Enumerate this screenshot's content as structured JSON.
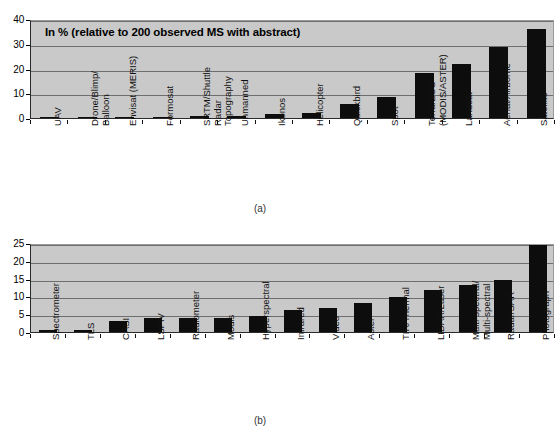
{
  "figure": {
    "panels": [
      {
        "id": "a",
        "caption": "(a)"
      },
      {
        "id": "b",
        "caption": "(b)"
      }
    ]
  },
  "chart_data": [
    {
      "type": "bar",
      "panel": "(a)",
      "title": "In % (relative to 200 observed MS with abstract)",
      "xlabel": "",
      "ylabel": "",
      "ylim": [
        0,
        40
      ],
      "yticks": [
        0,
        10,
        20,
        30,
        40
      ],
      "grid": true,
      "legend": "none",
      "categories": [
        "UAV",
        "Drone/Blimp/ Balloon",
        "Envisat (MERIS)",
        "Formosat",
        "SRTM/Shuttle Radar Topography",
        "Unmanned",
        "Ikonos",
        "Helicopter",
        "Quickbird",
        "Spot",
        "Terra/EOS (MODIS/ASTER)",
        "Landsat",
        "Aerial/Airborne",
        "Satellite"
      ],
      "category_lines": [
        [
          "UAV"
        ],
        [
          "Drone/Blimp/",
          "Balloon"
        ],
        [
          "Envisat (MERIS)"
        ],
        [
          "Formosat"
        ],
        [
          "SRTM/Shuttle",
          "Radar",
          "Topography"
        ],
        [
          "Unmanned"
        ],
        [
          "Ikonos"
        ],
        [
          "Helicopter"
        ],
        [
          "Quickbird"
        ],
        [
          "Spot"
        ],
        [
          "Terra/EOS",
          "(MODIS/ASTER)"
        ],
        [
          "Landsat"
        ],
        [
          "Aerial/Airborne"
        ],
        [
          "Satellite"
        ]
      ],
      "values": [
        0.5,
        0.5,
        0.5,
        0.5,
        1,
        1,
        1.5,
        2,
        5.5,
        8.5,
        18,
        22,
        28.5,
        36
      ]
    },
    {
      "type": "bar",
      "panel": "(b)",
      "title": "",
      "xlabel": "",
      "ylabel": "",
      "ylim": [
        0,
        25
      ],
      "yticks": [
        0,
        5,
        10,
        15,
        20,
        25
      ],
      "grid": true,
      "legend": "none",
      "categories": [
        "Spectrometer",
        "TLS",
        "CASI",
        "LSPIV",
        "Radiometer",
        "Modis",
        "Hyperspectral",
        "Infrared",
        "Video",
        "Aster",
        "TIR/Thermal",
        "LIDAR/Laser",
        "Multi-spectral/ Multi-spectral",
        "Radar/SAR",
        "Photograph"
      ],
      "category_lines": [
        [
          "Spectrometer"
        ],
        [
          "TLS"
        ],
        [
          "CASI"
        ],
        [
          "LSPIV"
        ],
        [
          "Radiometer"
        ],
        [
          "Modis"
        ],
        [
          "Hyperspectral"
        ],
        [
          "Infrared"
        ],
        [
          "Video"
        ],
        [
          "Aster"
        ],
        [
          "TIR/Thermal"
        ],
        [
          "LIDAR/Laser"
        ],
        [
          "Multi-spectral/",
          "Multi-spectral"
        ],
        [
          "Radar/SAR"
        ],
        [
          "Photograph"
        ]
      ],
      "values": [
        0.5,
        0.6,
        3,
        3.8,
        4,
        4,
        4.6,
        6.2,
        6.8,
        8.2,
        9.8,
        11.8,
        13.2,
        14.5,
        24.5
      ]
    }
  ],
  "colors": {
    "bar": "#0d0d0d",
    "plot_background": "#c9c9c9",
    "gridline": "#6e6e6e",
    "axis": "#2a2a2a",
    "text": "#000000"
  }
}
